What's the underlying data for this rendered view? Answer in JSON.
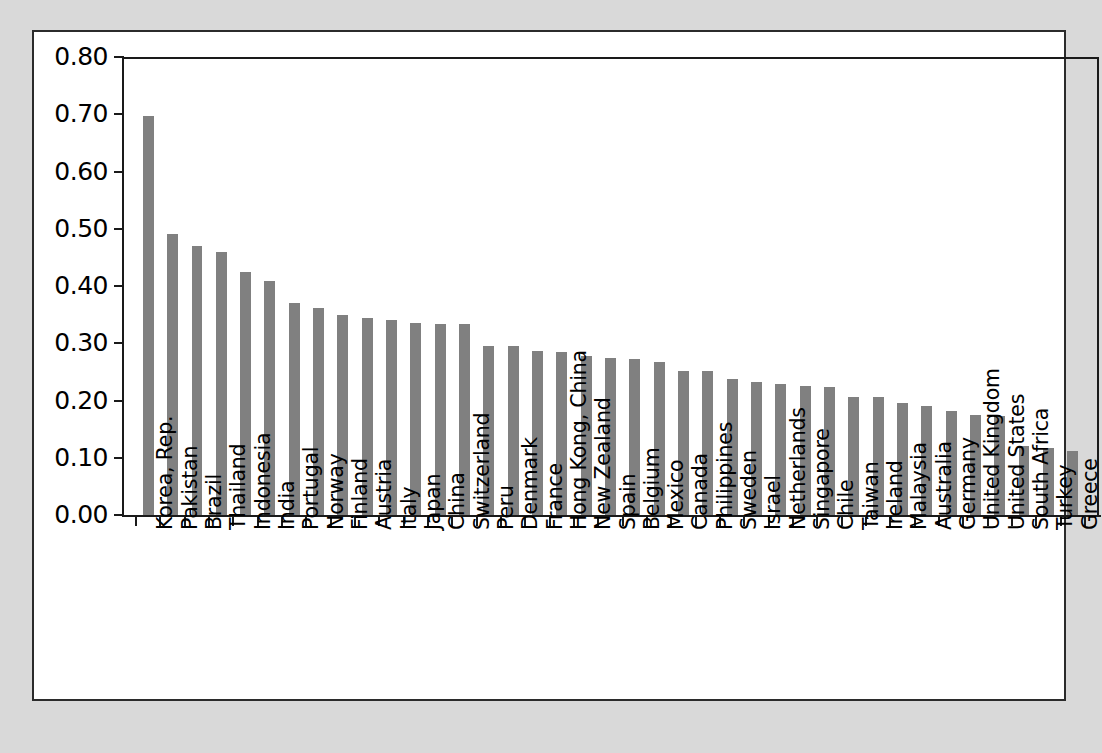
{
  "figure": {
    "background_color": "#d9d9d9",
    "panel_color": "#ffffff",
    "border_color": "#2b2b2b"
  },
  "chart_data": {
    "type": "bar",
    "title": "",
    "subtitle": "",
    "xlabel": "",
    "ylabel": "",
    "ylim": [
      0.0,
      0.8
    ],
    "ytick_labels": [
      "0.80",
      "0.70",
      "0.60",
      "0.50",
      "0.40",
      "0.30",
      "0.20",
      "0.10",
      "0.00"
    ],
    "ytick_values": [
      0.8,
      0.7,
      0.6,
      0.5,
      0.4,
      0.3,
      0.2,
      0.1,
      0.0
    ],
    "grid": false,
    "legend": false,
    "legend_position": "none",
    "bar_color": "#808080",
    "categories": [
      "Korea, Rep.",
      "Pakistan",
      "Brazil",
      "Thailand",
      "Indonesia",
      "India",
      "Portugal",
      "Norway",
      "Finland",
      "Austria",
      "Italy",
      "Japan",
      "China",
      "Switzerland",
      "Peru",
      "Denmark",
      "France",
      "Hong Kong, China",
      "New Zealand",
      "Spain",
      "Belgium",
      "Mexico",
      "Canada",
      "Philippines",
      "Sweden",
      "Israel",
      "Netherlands",
      "Singapore",
      "Chile",
      "Taiwan",
      "Ireland",
      "Malaysia",
      "Australia",
      "Germany",
      "United Kingdom",
      "United States",
      "South Africa",
      "Turkey",
      "Greece"
    ],
    "values": [
      0.697,
      0.49,
      0.47,
      0.46,
      0.425,
      0.408,
      0.37,
      0.362,
      0.35,
      0.344,
      0.341,
      0.336,
      0.333,
      0.333,
      0.296,
      0.295,
      0.287,
      0.284,
      0.278,
      0.274,
      0.272,
      0.268,
      0.251,
      0.251,
      0.238,
      0.233,
      0.228,
      0.225,
      0.223,
      0.206,
      0.206,
      0.196,
      0.191,
      0.182,
      0.174,
      0.173,
      0.12,
      0.117,
      0.112
    ]
  }
}
